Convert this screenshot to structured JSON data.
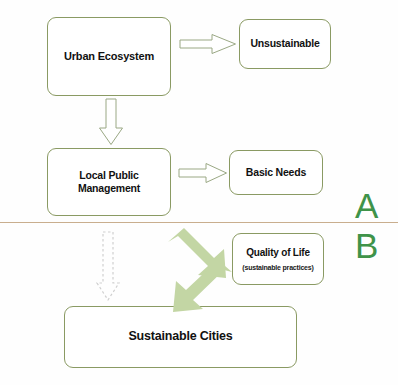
{
  "diagram": {
    "background_color": "#fefefe",
    "node_border_color": "#8a9a63",
    "block_arrow_color": "#c3d6a4",
    "divider_color": "#c9ae8e",
    "section_letter_color": "#3f9349"
  },
  "nodes": [
    {
      "id": "urban-ecosystem",
      "label": "Urban Ecosystem"
    },
    {
      "id": "unsustainable",
      "label": "Unsustainable"
    },
    {
      "id": "local-public-management",
      "label": "Local Public Management"
    },
    {
      "id": "basic-needs",
      "label": "Basic Needs"
    },
    {
      "id": "quality-of-life",
      "label": "Quality of Life",
      "sublabel": "(sustainable practices)"
    },
    {
      "id": "sustainable-cities",
      "label": "Sustainable Cities"
    }
  ],
  "sections": [
    {
      "id": "a",
      "label": "A"
    },
    {
      "id": "b",
      "label": "B"
    }
  ],
  "connectors": [
    {
      "id": "urban-to-unsustainable",
      "style": "hollow",
      "direction": "right",
      "from": "urban-ecosystem",
      "to": "unsustainable"
    },
    {
      "id": "urban-to-local",
      "style": "hollow",
      "direction": "down",
      "from": "urban-ecosystem",
      "to": "local-public-management"
    },
    {
      "id": "local-to-basic",
      "style": "hollow",
      "direction": "right",
      "from": "local-public-management",
      "to": "basic-needs"
    },
    {
      "id": "to-quality-of-life",
      "style": "solid",
      "direction": "down-right",
      "from": "local-public-management",
      "to": "quality-of-life"
    },
    {
      "id": "to-sustainable",
      "style": "solid",
      "direction": "down-left",
      "from": "quality-of-life",
      "to": "sustainable-cities"
    },
    {
      "id": "dashed-down",
      "style": "dashed",
      "direction": "down",
      "from": "local-public-management",
      "to": "sustainable-cities"
    }
  ]
}
